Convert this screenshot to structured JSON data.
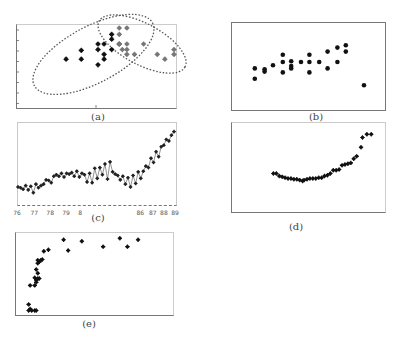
{
  "figure": {
    "panels": [
      {
        "id": "a",
        "caption": "(a)"
      },
      {
        "id": "b",
        "caption": "(b)"
      },
      {
        "id": "c",
        "caption": "(c)"
      },
      {
        "id": "d",
        "caption": "(d)"
      },
      {
        "id": "e",
        "caption": "(e)"
      }
    ]
  },
  "chart_data": [
    {
      "id": "a",
      "type": "scatter",
      "title": "(a)",
      "xlabel": "",
      "ylabel": "",
      "xlim": [
        0,
        100
      ],
      "ylim": [
        0,
        100
      ],
      "grid": false,
      "annotations": [
        "dotted ellipse around cluster 1 (black)",
        "dotted ellipse around cluster 2 (grey)"
      ],
      "series": [
        {
          "name": "cluster-1",
          "color": "#111111",
          "points": [
            [
              29,
              56
            ],
            [
              39,
              67
            ],
            [
              39,
              56
            ],
            [
              50,
              75
            ],
            [
              50,
              68
            ],
            [
              54,
              75
            ],
            [
              54,
              62
            ],
            [
              54,
              56
            ],
            [
              50,
              49
            ],
            [
              59,
              68
            ],
            [
              59,
              87
            ],
            [
              59,
              81
            ],
            [
              64,
              75
            ]
          ]
        },
        {
          "name": "cluster-2",
          "color": "#777777",
          "points": [
            [
              64,
              95
            ],
            [
              69,
              95
            ],
            [
              64,
              87
            ],
            [
              64,
              75
            ],
            [
              69,
              75
            ],
            [
              69,
              68
            ],
            [
              66,
              68
            ],
            [
              69,
              62
            ],
            [
              74,
              62
            ],
            [
              80,
              75
            ],
            [
              89,
              62
            ],
            [
              94,
              56
            ],
            [
              100,
              68
            ],
            [
              100,
              62
            ]
          ]
        }
      ],
      "ellipses": [
        {
          "cx": 47,
          "cy": 62,
          "rx": 44,
          "ry": 22,
          "rotate": -28
        },
        {
          "cx": 79,
          "cy": 75,
          "rx": 32,
          "ry": 16,
          "rotate": 28
        }
      ]
    },
    {
      "id": "b",
      "type": "scatter",
      "title": "(b)",
      "xlabel": "",
      "ylabel": "",
      "xlim": [
        0,
        100
      ],
      "ylim": [
        0,
        100
      ],
      "grid": false,
      "series": [
        {
          "name": "points",
          "color": "#111111",
          "points": [
            [
              12,
              47
            ],
            [
              12,
              34
            ],
            [
              19,
              46
            ],
            [
              19,
              43
            ],
            [
              25,
              51
            ],
            [
              32,
              64
            ],
            [
              32,
              55
            ],
            [
              32,
              42
            ],
            [
              38,
              56
            ],
            [
              38,
              50
            ],
            [
              38,
              47
            ],
            [
              45,
              55
            ],
            [
              51,
              64
            ],
            [
              51,
              55
            ],
            [
              51,
              42
            ],
            [
              58,
              55
            ],
            [
              64,
              68
            ],
            [
              64,
              47
            ],
            [
              71,
              55
            ],
            [
              71,
              73
            ],
            [
              77,
              68
            ],
            [
              77,
              76
            ],
            [
              90,
              26
            ]
          ]
        }
      ]
    },
    {
      "id": "c",
      "type": "line",
      "title": "(c)",
      "xlabel": "",
      "ylabel": "",
      "x_tick_labels": [
        "76",
        "77",
        "78",
        "79",
        "8",
        "86",
        "87",
        "88",
        "89"
      ],
      "x_tick_positions": [
        0,
        11,
        21,
        31,
        40,
        78,
        86,
        93,
        100
      ],
      "xlim": [
        0,
        100
      ],
      "ylim": [
        0,
        100
      ],
      "grid": false,
      "series": [
        {
          "name": "series",
          "color": "#222222",
          "values": [
            18,
            17,
            15,
            20,
            14,
            19,
            10,
            22,
            17,
            20,
            22,
            28,
            27,
            24,
            33,
            35,
            33,
            37,
            32,
            37,
            36,
            38,
            33,
            40,
            32,
            37,
            35,
            25,
            37,
            24,
            44,
            30,
            45,
            35,
            50,
            29,
            53,
            39,
            36,
            34,
            28,
            33,
            22,
            31,
            18,
            34,
            23,
            39,
            30,
            40,
            47,
            45,
            58,
            52,
            67,
            60,
            74,
            76,
            84,
            82,
            90,
            95
          ]
        }
      ]
    },
    {
      "id": "d",
      "type": "scatter",
      "title": "(d)",
      "xlabel": "",
      "ylabel": "",
      "xlim": [
        0,
        100
      ],
      "ylim": [
        0,
        100
      ],
      "grid": false,
      "series": [
        {
          "name": "points",
          "color": "#111111",
          "points": [
            [
              27,
              42
            ],
            [
              29,
              42
            ],
            [
              31,
              39
            ],
            [
              33,
              38
            ],
            [
              35,
              37
            ],
            [
              37,
              36
            ],
            [
              39,
              36
            ],
            [
              41,
              35
            ],
            [
              43,
              35
            ],
            [
              45,
              34
            ],
            [
              47,
              33
            ],
            [
              48,
              34
            ],
            [
              50,
              35
            ],
            [
              52,
              36
            ],
            [
              54,
              36
            ],
            [
              56,
              36
            ],
            [
              58,
              37
            ],
            [
              60,
              37
            ],
            [
              62,
              39
            ],
            [
              64,
              40
            ],
            [
              66,
              42
            ],
            [
              68,
              46
            ],
            [
              70,
              46
            ],
            [
              72,
              47
            ],
            [
              74,
              52
            ],
            [
              76,
              53
            ],
            [
              78,
              54
            ],
            [
              80,
              55
            ],
            [
              82,
              60
            ],
            [
              84,
              63
            ],
            [
              87,
              74
            ],
            [
              88,
              86
            ],
            [
              91,
              90
            ],
            [
              94,
              90
            ]
          ]
        }
      ]
    },
    {
      "id": "e",
      "type": "scatter",
      "title": "(e)",
      "xlabel": "",
      "ylabel": "",
      "xlim": [
        0,
        100
      ],
      "ylim": [
        0,
        100
      ],
      "grid": false,
      "series": [
        {
          "name": "points",
          "color": "#111111",
          "points": [
            [
              7,
              2
            ],
            [
              9,
              2
            ],
            [
              11,
              2
            ],
            [
              12,
              2
            ],
            [
              7,
              10
            ],
            [
              8,
              4
            ],
            [
              8,
              35
            ],
            [
              11,
              35
            ],
            [
              12,
              42
            ],
            [
              12,
              39
            ],
            [
              13,
              44
            ],
            [
              11,
              45
            ],
            [
              14,
              44
            ],
            [
              13,
              51
            ],
            [
              12,
              56
            ],
            [
              13,
              64
            ],
            [
              13,
              68
            ],
            [
              14,
              66
            ],
            [
              15,
              68
            ],
            [
              16,
              69
            ],
            [
              17,
              80
            ],
            [
              20,
              82
            ],
            [
              30,
              95
            ],
            [
              33,
              81
            ],
            [
              42,
              93
            ],
            [
              56,
              86
            ],
            [
              67,
              97
            ],
            [
              72,
              86
            ],
            [
              79,
              95
            ]
          ]
        }
      ]
    }
  ]
}
